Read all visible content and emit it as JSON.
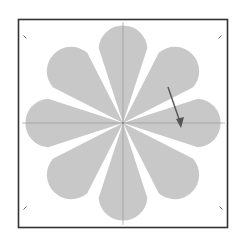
{
  "diagram": {
    "type": "radial-petal-diagram",
    "petal_count": 8,
    "center": [
      123,
      123
    ],
    "petal_radius": 101,
    "petal_span_deg": 36,
    "colors": {
      "background": "#ffffff",
      "frame": "#333333",
      "petal_fill": "#c8c8c8",
      "axis_line": "#999999",
      "arrow": "#555555",
      "corner_mark": "#666666"
    },
    "frame": {
      "x": 18,
      "y": 19,
      "width": 210,
      "height": 209
    },
    "arrow": {
      "from": [
        168,
        87
      ],
      "to": [
        181,
        126
      ]
    },
    "corner_marks": [
      {
        "name": "top-left",
        "x": 25,
        "y": 37
      },
      {
        "name": "top-right",
        "x": 220,
        "y": 37
      },
      {
        "name": "bottom-left",
        "x": 25,
        "y": 208
      },
      {
        "name": "bottom-right",
        "x": 221,
        "y": 208
      }
    ]
  }
}
